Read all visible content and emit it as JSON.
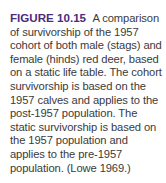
{
  "figure": {
    "label": "FIGURE 10.15",
    "caption": "A comparison of survivorship of the 1957 cohort of both male (stags) and female (hinds) red deer, based on a static life table. The cohort survivorship is based on the 1957 calves and applies to the post-1957 population. The static survivorship is based on the 1957 population and applies to the pre-1957 population. (Lowe 1969.)",
    "label_color": "#4b2c7d",
    "text_color": "#3a3a3a"
  }
}
